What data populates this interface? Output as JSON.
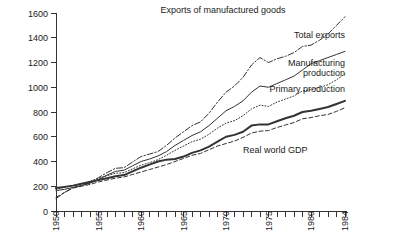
{
  "chart_data": {
    "type": "line",
    "title": "",
    "subtitle": "",
    "xlabel": "",
    "ylabel": "",
    "xlim": [
      1950,
      1984
    ],
    "ylim": [
      0,
      1600
    ],
    "grid": false,
    "legend_position": "inline-annotations",
    "y_ticks": [
      0,
      200,
      400,
      600,
      800,
      1000,
      1200,
      1400,
      1600
    ],
    "x_ticks": [
      1950,
      1951,
      1952,
      1953,
      1954,
      1955,
      1956,
      1957,
      1958,
      1959,
      1960,
      1961,
      1962,
      1963,
      1964,
      1965,
      1966,
      1967,
      1968,
      1969,
      1970,
      1971,
      1972,
      1973,
      1974,
      1975,
      1976,
      1977,
      1978,
      1979,
      1980,
      1981,
      1982,
      1983,
      1984
    ],
    "x_tick_labels": [
      {
        "year": 1950,
        "label": "1950"
      },
      {
        "year": 1955,
        "label": "1955"
      },
      {
        "year": 1960,
        "label": "1960"
      },
      {
        "year": 1965,
        "label": "1965"
      },
      {
        "year": 1970,
        "label": "1970"
      },
      {
        "year": 1975,
        "label": "1975"
      },
      {
        "year": 1980,
        "label": "1980"
      },
      {
        "year": 1984,
        "label": "1984"
      }
    ],
    "x": [
      1950,
      1951,
      1952,
      1953,
      1954,
      1955,
      1956,
      1957,
      1958,
      1959,
      1960,
      1961,
      1962,
      1963,
      1964,
      1965,
      1966,
      1967,
      1968,
      1969,
      1970,
      1971,
      1972,
      1973,
      1974,
      1975,
      1976,
      1977,
      1978,
      1979,
      1980,
      1981,
      1982,
      1983,
      1984
    ],
    "series": [
      {
        "name": "Exports of manufactured goods",
        "dash": "dash-dot",
        "width": 1,
        "label_x": 1977,
        "label_y": 1600,
        "label_anchor": "end",
        "values": [
          100,
          150,
          190,
          205,
          230,
          270,
          310,
          345,
          350,
          395,
          440,
          460,
          480,
          530,
          590,
          640,
          690,
          720,
          790,
          880,
          960,
          1010,
          1080,
          1180,
          1240,
          1200,
          1230,
          1250,
          1280,
          1330,
          1340,
          1380,
          1430,
          1500,
          1570
        ]
      },
      {
        "name": "Total exports",
        "dash": "solid",
        "width": 1,
        "label_x": 1984,
        "label_y": 1395,
        "label_anchor": "end",
        "values": [
          165,
          175,
          190,
          205,
          225,
          255,
          290,
          320,
          330,
          365,
          400,
          420,
          445,
          480,
          530,
          570,
          610,
          640,
          690,
          750,
          810,
          845,
          890,
          960,
          1010,
          1000,
          1030,
          1060,
          1090,
          1140,
          1190,
          1215,
          1240,
          1265,
          1290
        ]
      },
      {
        "name": "Manufacturing production",
        "dash": "dotted",
        "width": 1,
        "label_x": 1984,
        "label_y": 1175,
        "label_anchor": "end",
        "values": [
          175,
          190,
          205,
          220,
          240,
          265,
          285,
          305,
          310,
          340,
          370,
          390,
          415,
          450,
          490,
          525,
          560,
          580,
          620,
          670,
          710,
          730,
          770,
          825,
          855,
          845,
          880,
          905,
          930,
          970,
          980,
          1000,
          1020,
          1060,
          1110
        ]
      },
      {
        "name": "Primary production",
        "dash": "solid",
        "width": 2,
        "label_x": 1984,
        "label_y": 960,
        "label_anchor": "end",
        "values": [
          185,
          195,
          205,
          220,
          235,
          250,
          265,
          280,
          290,
          320,
          350,
          375,
          400,
          415,
          420,
          440,
          470,
          490,
          520,
          560,
          600,
          615,
          640,
          690,
          700,
          700,
          725,
          750,
          770,
          800,
          810,
          825,
          840,
          865,
          890
        ]
      },
      {
        "name": "Real world GDP",
        "dash": "dashed",
        "width": 1,
        "label_x": 1972,
        "label_y": 470,
        "label_anchor": "start",
        "values": [
          110,
          150,
          185,
          200,
          215,
          235,
          250,
          265,
          275,
          295,
          315,
          335,
          355,
          375,
          400,
          425,
          450,
          465,
          495,
          525,
          545,
          565,
          595,
          630,
          645,
          650,
          675,
          695,
          715,
          745,
          755,
          770,
          780,
          805,
          835
        ]
      }
    ]
  }
}
